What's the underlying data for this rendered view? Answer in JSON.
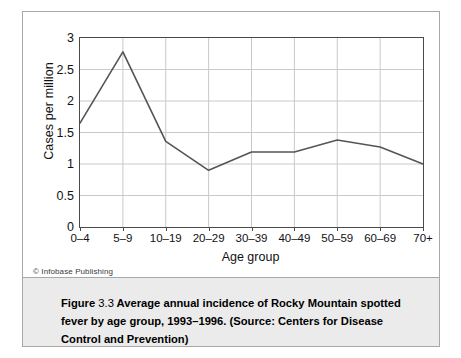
{
  "figure": {
    "caption_label": "Figure",
    "caption_number": "3.3",
    "caption_body": "Average annual incidence of Rocky Mountain spotted fever by age group, 1993–1996. (Source: Centers for Disease Control and Prevention)",
    "copyright": "© Infobase Publishing",
    "frame_color": "#a8a8a8",
    "caption_background": "#ebebeb"
  },
  "chart_data": {
    "type": "line",
    "title": "",
    "xlabel": "Age group",
    "ylabel": "Cases per million",
    "categories": [
      "0–4",
      "5–9",
      "10–19",
      "20–29",
      "30–39",
      "40–49",
      "50–59",
      "60–69",
      "70+"
    ],
    "values": [
      1.65,
      2.78,
      1.36,
      0.9,
      1.19,
      1.19,
      1.38,
      1.27,
      1.0
    ],
    "series": [
      {
        "name": "Cases per million",
        "values": [
          1.65,
          2.78,
          1.36,
          0.9,
          1.19,
          1.19,
          1.38,
          1.27,
          1.0
        ],
        "color": "#555555"
      }
    ],
    "ylim": [
      0,
      3
    ],
    "yticks": [
      0,
      0.5,
      1,
      1.5,
      2,
      2.5,
      3
    ],
    "ytick_labels": [
      "0",
      "0.5",
      "1",
      "1.5",
      "2",
      "2.5",
      "3"
    ],
    "grid": true,
    "grid_color": "#c9c9c9",
    "legend": "none",
    "line_color": "#555555",
    "axis_color": "#4a4a4a",
    "markers": "none"
  }
}
